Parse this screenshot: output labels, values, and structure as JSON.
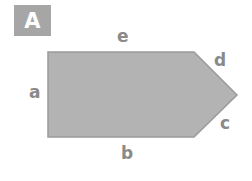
{
  "badge": {
    "label": "A",
    "color": "#a6a6a6"
  },
  "shape": {
    "type": "pentagon",
    "fill": "#b3b3b3",
    "stroke": "#9a9a9a",
    "points": "48,52 194,52 237,95 194,137 48,137"
  },
  "labels": {
    "a": "a",
    "b": "b",
    "c": "c",
    "d": "d",
    "e": "e"
  }
}
